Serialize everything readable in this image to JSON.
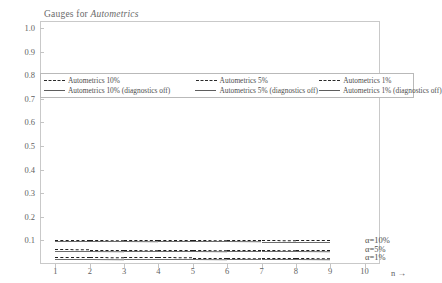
{
  "chart_data": {
    "type": "line",
    "title": "Gauges for Autometrics",
    "title_plain": "Gauges for ",
    "title_italic": "Autometrics",
    "xlabel": "n →",
    "ylabel": "",
    "xlim": [
      0.55,
      10.45
    ],
    "ylim": [
      0.0,
      1.03
    ],
    "grid": false,
    "legend_position": "upper-left-inside",
    "x": [
      1,
      2,
      3,
      4,
      5,
      6,
      7,
      8,
      9
    ],
    "yticks": [
      "1.0",
      "0.9",
      "0.8",
      "0.7",
      "0.6",
      "0.5",
      "0.4",
      "0.3",
      "0.2",
      "0.1"
    ],
    "ytick_values": [
      1.0,
      0.9,
      0.8,
      0.7,
      0.6,
      0.5,
      0.4,
      0.3,
      0.2,
      0.1
    ],
    "xticks": [
      "1",
      "2",
      "3",
      "4",
      "5",
      "6",
      "7",
      "8",
      "9",
      "10"
    ],
    "xtick_values": [
      1,
      2,
      3,
      4,
      5,
      6,
      7,
      8,
      9,
      10
    ],
    "series": [
      {
        "name": "Autometrics 10%",
        "style": "dashed",
        "values": [
          0.103,
          0.103,
          0.102,
          0.102,
          0.102,
          0.101,
          0.101,
          0.1,
          0.1
        ]
      },
      {
        "name": "Autometrics 5%",
        "style": "dashed",
        "values": [
          0.062,
          0.061,
          0.061,
          0.06,
          0.06,
          0.059,
          0.059,
          0.058,
          0.058
        ]
      },
      {
        "name": "Autometrics 1%",
        "style": "dashed",
        "values": [
          0.029,
          0.029,
          0.028,
          0.028,
          0.027,
          0.027,
          0.026,
          0.026,
          0.025
        ]
      },
      {
        "name": "Autometrics 10% (diagnostics off)",
        "style": "solid",
        "values": [
          0.097,
          0.097,
          0.097,
          0.096,
          0.096,
          0.096,
          0.095,
          0.095,
          0.095
        ]
      },
      {
        "name": "Autometrics 5% (diagnostics off)",
        "style": "solid",
        "values": [
          0.055,
          0.055,
          0.054,
          0.054,
          0.054,
          0.053,
          0.053,
          0.053,
          0.052
        ]
      },
      {
        "name": "Autometrics 1% (diagnostics off)",
        "style": "solid",
        "values": [
          0.023,
          0.023,
          0.022,
          0.022,
          0.022,
          0.021,
          0.021,
          0.021,
          0.02
        ]
      }
    ],
    "annotations": [
      {
        "text": "α=10%",
        "y": 0.103
      },
      {
        "text": "α=5%",
        "y": 0.062
      },
      {
        "text": "α=1%",
        "y": 0.028
      }
    ]
  },
  "legend": {
    "rows": [
      [
        {
          "label": "Autometrics 10%",
          "style": "dashed"
        },
        {
          "label": "Autometrics 5%",
          "style": "dashed"
        },
        {
          "label": "Autometrics 1%",
          "style": "dashed"
        }
      ],
      [
        {
          "label": "Autometrics 10% (diagnostics off)",
          "style": "solid"
        },
        {
          "label": "Autometrics 5% (diagnostics off)",
          "style": "solid"
        },
        {
          "label": "Autometrics 1% (diagnostics off)",
          "style": "solid"
        }
      ]
    ]
  },
  "colors": {
    "background": "#ffffff",
    "frame": "#c9c9c9",
    "dashed_line": "#1f1f1f",
    "solid_line": "#6e6e6e",
    "text": "#5a5a5a"
  }
}
